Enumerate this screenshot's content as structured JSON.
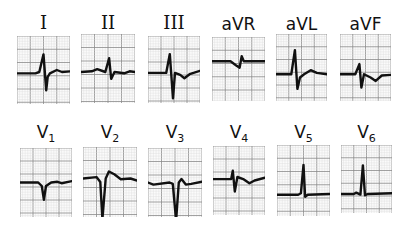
{
  "figure": {
    "rows": [
      {
        "name": "limb-leads",
        "leads": [
          {
            "id": "I",
            "label": "I",
            "sub": "",
            "roman": true,
            "baseline": 0.55,
            "complex": [
              [
                0,
                0
              ],
              [
                0.35,
                0
              ],
              [
                0.42,
                -0.02
              ],
              [
                0.5,
                -0.28
              ],
              [
                0.55,
                0.25
              ],
              [
                0.58,
                0.05
              ],
              [
                0.62,
                0
              ],
              [
                0.75,
                -0.05
              ],
              [
                0.85,
                -0.02
              ],
              [
                1,
                -0.03
              ]
            ]
          },
          {
            "id": "II",
            "label": "II",
            "sub": "",
            "roman": true,
            "baseline": 0.55,
            "complex": [
              [
                0,
                0
              ],
              [
                0.2,
                -0.01
              ],
              [
                0.3,
                -0.04
              ],
              [
                0.45,
                0
              ],
              [
                0.52,
                -0.2
              ],
              [
                0.56,
                0.1
              ],
              [
                0.62,
                0
              ],
              [
                0.8,
                0.02
              ],
              [
                0.9,
                -0.01
              ],
              [
                1,
                0
              ]
            ]
          },
          {
            "id": "III",
            "label": "III",
            "sub": "",
            "roman": true,
            "baseline": 0.55,
            "complex": [
              [
                0,
                0
              ],
              [
                0.35,
                0
              ],
              [
                0.42,
                -0.28
              ],
              [
                0.48,
                0.38
              ],
              [
                0.52,
                0
              ],
              [
                0.62,
                0.03
              ],
              [
                0.7,
                0.08
              ],
              [
                0.8,
                0.02
              ],
              [
                1,
                -0.03
              ]
            ]
          },
          {
            "id": "aVR",
            "label": "aVR",
            "sub": "",
            "roman": false,
            "baseline": 0.38,
            "complex": [
              [
                0,
                0
              ],
              [
                0.35,
                0
              ],
              [
                0.45,
                0.06
              ],
              [
                0.52,
                0.1
              ],
              [
                0.56,
                -0.08
              ],
              [
                0.6,
                0
              ],
              [
                1,
                0
              ]
            ]
          },
          {
            "id": "aVL",
            "label": "aVL",
            "sub": "",
            "roman": false,
            "baseline": 0.6,
            "complex": [
              [
                0,
                0
              ],
              [
                0.3,
                0
              ],
              [
                0.37,
                -0.36
              ],
              [
                0.42,
                0.22
              ],
              [
                0.47,
                0.05
              ],
              [
                0.55,
                0
              ],
              [
                0.68,
                -0.06
              ],
              [
                0.8,
                -0.02
              ],
              [
                1,
                0
              ]
            ]
          },
          {
            "id": "aVF",
            "label": "aVF",
            "sub": "",
            "roman": false,
            "baseline": 0.6,
            "complex": [
              [
                0,
                0
              ],
              [
                0.3,
                0
              ],
              [
                0.38,
                -0.15
              ],
              [
                0.42,
                0.2
              ],
              [
                0.47,
                0
              ],
              [
                0.6,
                0.05
              ],
              [
                0.7,
                0.1
              ],
              [
                0.82,
                0.02
              ],
              [
                1,
                0.01
              ]
            ]
          }
        ]
      },
      {
        "name": "precordial-leads",
        "leads": [
          {
            "id": "V1",
            "label": "V",
            "sub": "1",
            "roman": false,
            "baseline": 0.5,
            "complex": [
              [
                0,
                0
              ],
              [
                0.35,
                0
              ],
              [
                0.42,
                0.05
              ],
              [
                0.46,
                0.25
              ],
              [
                0.5,
                0.05
              ],
              [
                0.6,
                0
              ],
              [
                0.72,
                -0.01
              ],
              [
                0.8,
                0.01
              ],
              [
                1,
                -0.02
              ]
            ]
          },
          {
            "id": "V2",
            "label": "V",
            "sub": "2",
            "roman": false,
            "baseline": 0.45,
            "complex": [
              [
                0,
                0
              ],
              [
                0.25,
                -0.02
              ],
              [
                0.32,
                0.05
              ],
              [
                0.36,
                0.58
              ],
              [
                0.42,
                0
              ],
              [
                0.48,
                -0.1
              ],
              [
                0.58,
                -0.06
              ],
              [
                0.7,
                0.01
              ],
              [
                0.88,
                0.0
              ],
              [
                1,
                0.03
              ]
            ]
          },
          {
            "id": "V3",
            "label": "V",
            "sub": "3",
            "roman": false,
            "baseline": 0.5,
            "complex": [
              [
                0,
                0
              ],
              [
                0.1,
                0.03
              ],
              [
                0.4,
                0.0
              ],
              [
                0.46,
                0.02
              ],
              [
                0.52,
                0.55
              ],
              [
                0.57,
                0
              ],
              [
                0.62,
                -0.05
              ],
              [
                0.7,
                0.03
              ],
              [
                0.8,
                0.02
              ],
              [
                1,
                -0.01
              ]
            ]
          },
          {
            "id": "V4",
            "label": "V",
            "sub": "4",
            "roman": false,
            "baseline": 0.48,
            "complex": [
              [
                0,
                0
              ],
              [
                0.35,
                0
              ],
              [
                0.38,
                -0.12
              ],
              [
                0.42,
                0.18
              ],
              [
                0.47,
                -0.03
              ],
              [
                0.58,
                0
              ],
              [
                0.7,
                0.06
              ],
              [
                0.8,
                0.02
              ],
              [
                1,
                -0.02
              ]
            ]
          },
          {
            "id": "V5",
            "label": "V",
            "sub": "5",
            "roman": false,
            "baseline": 0.7,
            "complex": [
              [
                0,
                0
              ],
              [
                0.4,
                0
              ],
              [
                0.45,
                -0.02
              ],
              [
                0.5,
                -0.42
              ],
              [
                0.53,
                0.03
              ],
              [
                0.58,
                0
              ],
              [
                1,
                -0.01
              ]
            ]
          },
          {
            "id": "V6",
            "label": "V",
            "sub": "6",
            "roman": false,
            "baseline": 0.72,
            "complex": [
              [
                0,
                0
              ],
              [
                0.25,
                0
              ],
              [
                0.3,
                -0.02
              ],
              [
                0.38,
                0.01
              ],
              [
                0.43,
                -0.42
              ],
              [
                0.47,
                0.02
              ],
              [
                0.52,
                0
              ],
              [
                1,
                -0.01
              ]
            ]
          }
        ]
      }
    ]
  }
}
